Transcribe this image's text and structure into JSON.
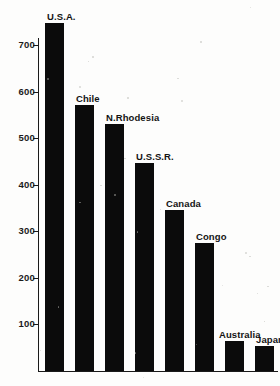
{
  "chart_data": {
    "type": "bar",
    "title": "",
    "subtitle": "",
    "xlabel": "",
    "ylabel": "",
    "categories": [
      "U.S.A.",
      "Chile",
      "N.Rhodesia",
      "U.S.S.R.",
      "Canada",
      "Congo",
      "Australia",
      "Japan"
    ],
    "values": [
      748,
      572,
      531,
      447,
      346,
      275,
      64,
      52
    ],
    "ylim": [
      0,
      760
    ],
    "yticks": [
      100,
      200,
      300,
      400,
      500,
      600,
      700
    ],
    "ytick_labels": [
      "100",
      "200",
      "300",
      "400",
      "500",
      "600",
      "700"
    ],
    "grid": false,
    "legend": false,
    "legend_position": "none",
    "bar_color": "#0b0b0b",
    "axis_color": "#1a1a1a",
    "background_color": "#fdfdfc",
    "annotations": [
      {
        "text": "U.S.A.",
        "attached_to": "U.S.A.",
        "position": "above-bar"
      },
      {
        "text": "Chile",
        "attached_to": "Chile",
        "position": "above-bar"
      },
      {
        "text": "N.Rhodesia",
        "attached_to": "N.Rhodesia",
        "position": "above-bar"
      },
      {
        "text": "U.S.S.R.",
        "attached_to": "U.S.S.R.",
        "position": "above-bar"
      },
      {
        "text": "Canada",
        "attached_to": "Canada",
        "position": "above-bar"
      },
      {
        "text": "Congo",
        "attached_to": "Congo",
        "position": "above-bar"
      },
      {
        "text": "Australia",
        "attached_to": "Australia",
        "position": "above-bar"
      },
      {
        "text": "Japan",
        "attached_to": "Japan",
        "position": "above-bar"
      }
    ]
  },
  "axis": {
    "ticks": [
      {
        "label": "700",
        "value": 700
      },
      {
        "label": "600",
        "value": 600
      },
      {
        "label": "500",
        "value": 500
      },
      {
        "label": "400",
        "value": 400
      },
      {
        "label": "300",
        "value": 300
      },
      {
        "label": "200",
        "value": 200
      },
      {
        "label": "100",
        "value": 100
      }
    ]
  },
  "bars": [
    {
      "label": "U.S.A.",
      "value": 748
    },
    {
      "label": "Chile",
      "value": 572
    },
    {
      "label": "N.Rhodesia",
      "value": 531
    },
    {
      "label": "U.S.S.R.",
      "value": 447
    },
    {
      "label": "Canada",
      "value": 346
    },
    {
      "label": "Congo",
      "value": 275
    },
    {
      "label": "Australia",
      "value": 64
    },
    {
      "label": "Japan",
      "value": 52
    }
  ]
}
